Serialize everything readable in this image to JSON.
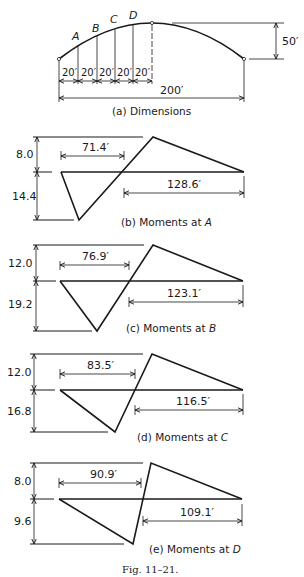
{
  "figure": {
    "caption": "Fig. 11–21.",
    "stroke_color": "#1a1a1a",
    "background": "#ffffff"
  },
  "dimensions": {
    "caption": "(a) Dimensions",
    "point_labels": [
      "A",
      "B",
      "C",
      "D"
    ],
    "segment_labels": [
      "20′",
      "20′",
      "20′",
      "20′",
      "20′"
    ],
    "span_label": "200′",
    "rise_label": "50′"
  },
  "panels": [
    {
      "id": "b",
      "caption_prefix": "(b) Moments at ",
      "caption_point": "A",
      "positive_ordinate": "8.0",
      "negative_ordinate": "14.4",
      "left_distance": "71.4′",
      "right_distance": "128.6′"
    },
    {
      "id": "c",
      "caption_prefix": "(c) Moments at ",
      "caption_point": "B",
      "positive_ordinate": "12.0",
      "negative_ordinate": "19.2",
      "left_distance": "76.9′",
      "right_distance": "123.1′"
    },
    {
      "id": "d",
      "caption_prefix": "(d) Moments at ",
      "caption_point": "C",
      "positive_ordinate": "12.0",
      "negative_ordinate": "16.8",
      "left_distance": "83.5′",
      "right_distance": "116.5′"
    },
    {
      "id": "e",
      "caption_prefix": "(e) Moments at ",
      "caption_point": "D",
      "positive_ordinate": "8.0",
      "negative_ordinate": "9.6",
      "left_distance": "90.9′",
      "right_distance": "109.1′"
    }
  ]
}
